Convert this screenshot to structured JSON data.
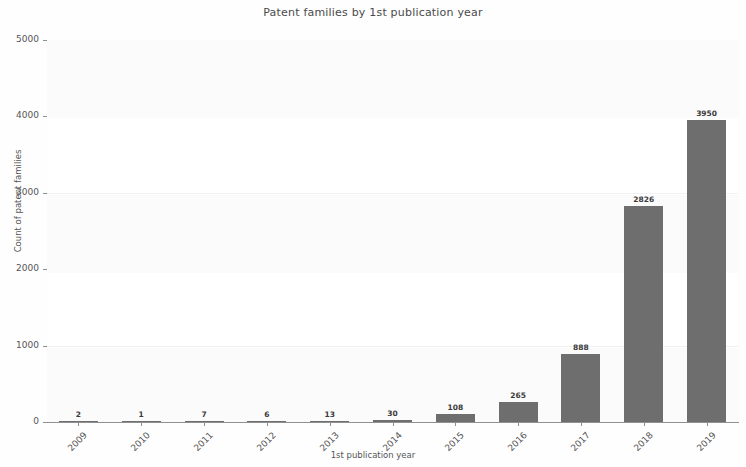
{
  "chart_data": {
    "type": "bar",
    "title": "Patent families by 1st publication year",
    "xlabel": "1st publication year",
    "ylabel": "Count of patent families",
    "categories": [
      "2009",
      "2010",
      "2011",
      "2012",
      "2013",
      "2014",
      "2015",
      "2016",
      "2017",
      "2018",
      "2019"
    ],
    "values": [
      2,
      1,
      7,
      6,
      13,
      30,
      108,
      265,
      888,
      2826,
      3950
    ],
    "value_labels": [
      "2",
      "1",
      "7",
      "6",
      "13",
      "30",
      "108",
      "265",
      "888",
      "2826",
      "3950"
    ],
    "ylim": [
      0,
      5000
    ],
    "ytick_labels": [
      "0",
      "1000",
      "2000",
      "3000",
      "4000",
      "5000"
    ],
    "ytick_values": [
      0,
      1000,
      2000,
      3000,
      4000,
      5000
    ],
    "grid": true,
    "legend": false,
    "bar_color": "#6e6e6e",
    "background_color": "#ffffff",
    "axis_color": "#909090",
    "text_color": "#555555"
  }
}
